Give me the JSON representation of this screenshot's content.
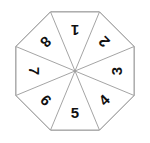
{
  "figure": {
    "name": "numbered-octagon-spinner",
    "type": "spinner-diagram",
    "background_color": "#ffffff",
    "outline_color": "#808080",
    "spoke_color": "#9a9a9a",
    "label_color": "#111111",
    "sector_count": 8,
    "center": {
      "x": 75,
      "y": 71
    },
    "radius": 64,
    "label_radius": 41
  },
  "sectors": [
    {
      "id": "sector-1",
      "label": "1",
      "angle_deg": 270,
      "label_rotation_deg": 180
    },
    {
      "id": "sector-2",
      "label": "2",
      "angle_deg": 315,
      "label_rotation_deg": 225
    },
    {
      "id": "sector-3",
      "label": "3",
      "angle_deg": 0,
      "label_rotation_deg": 270
    },
    {
      "id": "sector-4",
      "label": "4",
      "angle_deg": 45,
      "label_rotation_deg": 315
    },
    {
      "id": "sector-5",
      "label": "5",
      "angle_deg": 90,
      "label_rotation_deg": 0
    },
    {
      "id": "sector-6",
      "label": "6",
      "angle_deg": 135,
      "label_rotation_deg": 45
    },
    {
      "id": "sector-7",
      "label": "7",
      "angle_deg": 180,
      "label_rotation_deg": 90
    },
    {
      "id": "sector-8",
      "label": "8",
      "angle_deg": 225,
      "label_rotation_deg": 135
    }
  ],
  "vertices_deg": [
    247.5,
    292.5,
    337.5,
    22.5,
    67.5,
    112.5,
    157.5,
    202.5
  ]
}
